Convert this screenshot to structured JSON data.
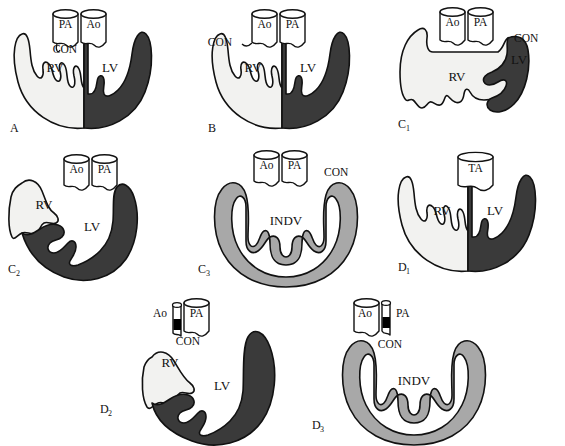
{
  "figure": {
    "type": "anatomical-schematic-grid",
    "background_color": "#ffffff",
    "colors": {
      "right_ventricle_fill": "#f2f2f0",
      "left_ventricle_fill": "#3a3a3a",
      "indeterminate_ventricle_fill": "#a8a8a8",
      "vessel_fill": "#ffffff",
      "atretic_valve_fill": "#000000",
      "outline": "#111111",
      "text": "#111111"
    },
    "legend_terms": {
      "RV": "right ventricle",
      "LV": "left ventricle",
      "INDV": "indeterminate ventricle",
      "CON": "conus",
      "Ao": "aorta",
      "PA": "pulmonary artery",
      "TA": "truncus arteriosus"
    }
  },
  "panels": [
    {
      "id": "panel-a",
      "label": "A",
      "sublabel": "",
      "vessels": [
        {
          "name": "PA",
          "label": "PA",
          "position": "left",
          "atretic": false
        },
        {
          "name": "Ao",
          "label": "Ao",
          "position": "right",
          "atretic": false
        }
      ],
      "conus": {
        "label": "CON",
        "position": "center-left"
      },
      "chambers": [
        {
          "name": "RV",
          "label": "RV",
          "fill": "#f2f2f0",
          "side": "left",
          "size": "normal"
        },
        {
          "name": "LV",
          "label": "LV",
          "fill": "#3a3a3a",
          "side": "right",
          "size": "normal"
        }
      ]
    },
    {
      "id": "panel-b",
      "label": "B",
      "sublabel": "",
      "vessels": [
        {
          "name": "Ao",
          "label": "Ao",
          "position": "left",
          "atretic": false
        },
        {
          "name": "PA",
          "label": "PA",
          "position": "right",
          "atretic": false
        }
      ],
      "conus": {
        "label": "CON",
        "position": "upper-left"
      },
      "chambers": [
        {
          "name": "RV",
          "label": "RV",
          "fill": "#f2f2f0",
          "side": "left",
          "size": "normal"
        },
        {
          "name": "LV",
          "label": "LV",
          "fill": "#3a3a3a",
          "side": "right",
          "size": "normal"
        }
      ]
    },
    {
      "id": "panel-c1",
      "label": "C",
      "sublabel": "1",
      "vessels": [
        {
          "name": "Ao",
          "label": "Ao",
          "position": "left",
          "atretic": false
        },
        {
          "name": "PA",
          "label": "PA",
          "position": "right",
          "atretic": false
        }
      ],
      "conus": {
        "label": "CON",
        "position": "upper-right"
      },
      "chambers": [
        {
          "name": "RV",
          "label": "RV",
          "fill": "#f2f2f0",
          "side": "dominant",
          "size": "dominant"
        },
        {
          "name": "LV",
          "label": "LV",
          "fill": "#3a3a3a",
          "side": "right",
          "size": "small"
        }
      ]
    },
    {
      "id": "panel-c2",
      "label": "C",
      "sublabel": "2",
      "vessels": [
        {
          "name": "Ao",
          "label": "Ao",
          "position": "left",
          "atretic": false
        },
        {
          "name": "PA",
          "label": "PA",
          "position": "right",
          "atretic": false
        }
      ],
      "conus": {
        "label": "",
        "position": "none"
      },
      "chambers": [
        {
          "name": "RV",
          "label": "RV",
          "fill": "#f2f2f0",
          "side": "left",
          "size": "small"
        },
        {
          "name": "LV",
          "label": "LV",
          "fill": "#3a3a3a",
          "side": "dominant",
          "size": "dominant"
        }
      ]
    },
    {
      "id": "panel-c3",
      "label": "C",
      "sublabel": "3",
      "vessels": [
        {
          "name": "Ao",
          "label": "Ao",
          "position": "left",
          "atretic": false
        },
        {
          "name": "PA",
          "label": "PA",
          "position": "right",
          "atretic": false
        }
      ],
      "conus": {
        "label": "CON",
        "position": "upper-right"
      },
      "chambers": [
        {
          "name": "INDV",
          "label": "INDV",
          "fill": "#a8a8a8",
          "side": "single",
          "size": "single"
        }
      ]
    },
    {
      "id": "panel-d1",
      "label": "D",
      "sublabel": "1",
      "vessels": [
        {
          "name": "TA",
          "label": "TA",
          "position": "center",
          "atretic": false
        }
      ],
      "conus": {
        "label": "",
        "position": "none"
      },
      "chambers": [
        {
          "name": "RV",
          "label": "RV",
          "fill": "#f2f2f0",
          "side": "left",
          "size": "normal"
        },
        {
          "name": "LV",
          "label": "LV",
          "fill": "#3a3a3a",
          "side": "right",
          "size": "normal"
        }
      ]
    },
    {
      "id": "panel-d2",
      "label": "D",
      "sublabel": "2",
      "vessels": [
        {
          "name": "Ao",
          "label": "Ao",
          "position": "left",
          "atretic": true
        },
        {
          "name": "PA",
          "label": "PA",
          "position": "right",
          "atretic": false
        }
      ],
      "conus": {
        "label": "CON",
        "position": "below-center"
      },
      "chambers": [
        {
          "name": "RV",
          "label": "RV",
          "fill": "#f2f2f0",
          "side": "left",
          "size": "small"
        },
        {
          "name": "LV",
          "label": "LV",
          "fill": "#3a3a3a",
          "side": "dominant",
          "size": "dominant"
        }
      ]
    },
    {
      "id": "panel-d3",
      "label": "D",
      "sublabel": "3",
      "vessels": [
        {
          "name": "Ao",
          "label": "Ao",
          "position": "left",
          "atretic": false
        },
        {
          "name": "PA",
          "label": "PA",
          "position": "right",
          "atretic": true
        }
      ],
      "conus": {
        "label": "CON",
        "position": "below-center"
      },
      "chambers": [
        {
          "name": "INDV",
          "label": "INDV",
          "fill": "#a8a8a8",
          "side": "single",
          "size": "single"
        }
      ]
    }
  ]
}
